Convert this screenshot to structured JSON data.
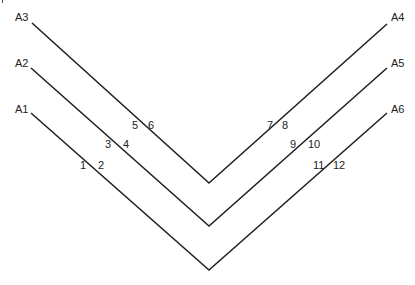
{
  "diagram": {
    "line_color": "#222222",
    "end_labels": [
      {
        "id": "A3",
        "label": "A3",
        "x": 15,
        "y": 12
      },
      {
        "id": "A2",
        "label": "A2",
        "x": 15,
        "y": 58
      },
      {
        "id": "A1",
        "label": "A1",
        "x": 15,
        "y": 104
      },
      {
        "id": "A4",
        "label": "A4",
        "x": 391,
        "y": 12
      },
      {
        "id": "A5",
        "label": "A5",
        "x": 391,
        "y": 58
      },
      {
        "id": "A6",
        "label": "A6",
        "x": 391,
        "y": 104
      }
    ],
    "point_labels": [
      {
        "label": "1",
        "x": 80,
        "y": 160
      },
      {
        "label": "2",
        "x": 98,
        "y": 160
      },
      {
        "label": "3",
        "x": 105,
        "y": 139
      },
      {
        "label": "4",
        "x": 123,
        "y": 139
      },
      {
        "label": "5",
        "x": 132,
        "y": 120
      },
      {
        "label": "6",
        "x": 148,
        "y": 120
      },
      {
        "label": "7",
        "x": 267,
        "y": 120
      },
      {
        "label": "8",
        "x": 282,
        "y": 120
      },
      {
        "label": "9",
        "x": 290,
        "y": 139
      },
      {
        "label": "10",
        "x": 308,
        "y": 139
      },
      {
        "label": "11",
        "x": 313,
        "y": 160
      },
      {
        "label": "12",
        "x": 333,
        "y": 160
      }
    ],
    "paths": [
      {
        "name": "path-a3-a4",
        "from": "A3",
        "to": "A4",
        "points": "32,23 209,183 387,24"
      },
      {
        "name": "path-a2-a5",
        "from": "A2",
        "to": "A5",
        "points": "31,68 209,226 387,68"
      },
      {
        "name": "path-a1-a6",
        "from": "A1",
        "to": "A6",
        "points": "31,113 209,270 387,113"
      }
    ]
  }
}
